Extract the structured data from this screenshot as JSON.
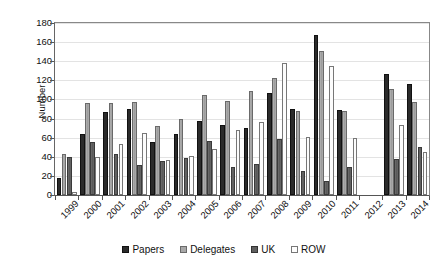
{
  "chart_data": {
    "type": "bar",
    "title": "",
    "xlabel": "",
    "ylabel": "Number",
    "ylim": [
      0,
      180
    ],
    "ytick_step": 20,
    "yticks": [
      0,
      20,
      40,
      60,
      80,
      100,
      120,
      140,
      160,
      180
    ],
    "grid": true,
    "legend_position": "bottom",
    "categories": [
      "1999",
      "2000",
      "2001",
      "2002",
      "2003",
      "2004",
      "2005",
      "2006",
      "2007",
      "2008",
      "2009",
      "2010",
      "2011",
      "2012",
      "2013",
      "2014"
    ],
    "series": [
      {
        "name": "Papers",
        "color": "#2b2b2b",
        "values": [
          18,
          64,
          87,
          90,
          55,
          64,
          77,
          73,
          70,
          107,
          90,
          167,
          89,
          null,
          127,
          116
        ]
      },
      {
        "name": "Delegates",
        "color": "#a8a8a8",
        "values": [
          43,
          96,
          96,
          97,
          72,
          80,
          105,
          98,
          109,
          122,
          88,
          151,
          88,
          null,
          111,
          97
        ]
      },
      {
        "name": "UK",
        "color": "#5f5f5f",
        "values": [
          40,
          56,
          43,
          31,
          36,
          39,
          57,
          29,
          32,
          59,
          25,
          15,
          29,
          null,
          38,
          50
        ]
      },
      {
        "name": "ROW",
        "color": "#fdfdfd",
        "values": [
          3,
          40,
          53,
          65,
          37,
          41,
          48,
          68,
          76,
          138,
          61,
          135,
          60,
          null,
          73,
          45
        ]
      }
    ]
  },
  "legend": {
    "items": [
      {
        "label": "Papers",
        "swatch": "papers-swatch-icon"
      },
      {
        "label": "Delegates",
        "swatch": "delegates-swatch-icon"
      },
      {
        "label": "UK",
        "swatch": "uk-swatch-icon"
      },
      {
        "label": "ROW",
        "swatch": "row-swatch-icon"
      }
    ]
  },
  "axes": {
    "y_title": "Number"
  }
}
